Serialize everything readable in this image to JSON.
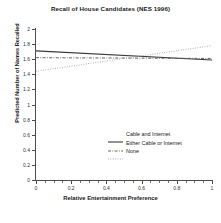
{
  "chart_data": {
    "type": "line",
    "title": "Recall of House Candidates (NES 1996)",
    "xlabel": "Relative Entertainment Preference",
    "ylabel": "Predicted Number of Names Recalled",
    "xlim": [
      0,
      1
    ],
    "ylim": [
      0,
      2
    ],
    "grid": false,
    "legend_position": "lower right",
    "xticks": [
      0,
      0.2,
      0.4,
      0.6,
      0.8,
      1
    ],
    "xtick_labels": [
      "0",
      "0.2",
      "0.4",
      "0.6",
      "0.8",
      "1"
    ],
    "yticks": [
      0,
      0.2,
      0.4,
      0.6,
      0.8,
      1,
      1.2,
      1.4,
      1.6,
      1.8,
      2
    ],
    "ytick_labels": [
      "0",
      "0.2",
      "0.4",
      "0.6",
      "0.8",
      "1",
      "1.2",
      "1.4",
      "1.6",
      "1.8",
      "2"
    ],
    "x": [
      0,
      1
    ],
    "series": [
      {
        "name": "Cable and Internet",
        "style": "solid",
        "color": "#3a3a3a",
        "values": [
          1.71,
          1.59
        ]
      },
      {
        "name": "Either Cable or Internet",
        "style": "dashdot",
        "color": "#5a5a5a",
        "values": [
          1.62,
          1.61
        ]
      },
      {
        "name": "None",
        "style": "dotted",
        "color": "#9a9a9a",
        "values": [
          1.44,
          1.78
        ]
      }
    ]
  },
  "legend": {
    "items": [
      {
        "label": "Cable and Internet"
      },
      {
        "label": "Either Cable or Internet"
      },
      {
        "label": "None"
      }
    ]
  }
}
